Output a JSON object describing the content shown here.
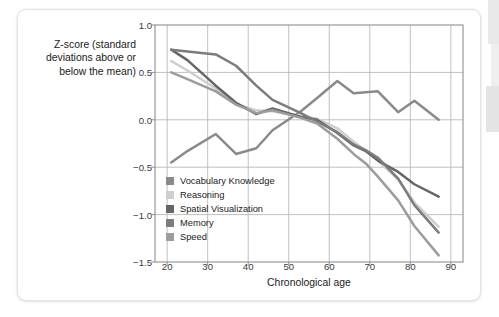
{
  "figure": {
    "background_color": "#ffffff",
    "card_border_color": "#e3e3e3"
  },
  "chart_data": {
    "type": "line",
    "title": "",
    "xlabel": "Chronological age",
    "ylabel": "Z-score (standard deviations above or below the mean)",
    "ylabel_lines": [
      "Z-score (standard",
      "deviations above or",
      "below the mean)"
    ],
    "xlim": [
      17,
      93
    ],
    "ylim": [
      -1.5,
      1.0
    ],
    "xticks": [
      20,
      30,
      40,
      50,
      60,
      70,
      80,
      90
    ],
    "xtick_labels": [
      "20",
      "30",
      "40",
      "50",
      "60",
      "70",
      "80",
      "90"
    ],
    "yticks": [
      1.0,
      0.5,
      0.0,
      -0.5,
      -1.0,
      -1.5
    ],
    "ytick_labels": [
      "1.0",
      "0.5",
      "0.0",
      "-0.5",
      "-1.0",
      "-1.5"
    ],
    "grid": true,
    "grid_color": "#b9b9b9",
    "axis_color": "#8f8f8f",
    "legend_position": "inside-lower-left",
    "series": [
      {
        "name": "Vocabulary Knowledge",
        "color": "#8a8a8a",
        "x": [
          21,
          25,
          32,
          37,
          42,
          46,
          53,
          57,
          62,
          66,
          69,
          72,
          77,
          81,
          87
        ],
        "y": [
          -0.45,
          -0.33,
          -0.15,
          -0.36,
          -0.3,
          -0.11,
          0.09,
          0.23,
          0.41,
          0.28,
          0.29,
          0.3,
          0.08,
          0.2,
          0.0
        ]
      },
      {
        "name": "Reasoning",
        "color": "#cecece",
        "x": [
          21,
          25,
          32,
          37,
          42,
          46,
          53,
          57,
          62,
          66,
          69,
          72,
          77,
          81,
          87
        ],
        "y": [
          0.62,
          0.52,
          0.33,
          0.17,
          0.1,
          0.09,
          0.04,
          0.01,
          -0.09,
          -0.23,
          -0.33,
          -0.43,
          -0.63,
          -0.87,
          -1.13
        ]
      },
      {
        "name": "Spatial Visualization",
        "color": "#666666",
        "x": [
          21,
          25,
          32,
          37,
          42,
          46,
          53,
          57,
          62,
          66,
          69,
          72,
          77,
          81,
          87
        ],
        "y": [
          0.74,
          0.63,
          0.36,
          0.18,
          0.06,
          0.12,
          0.03,
          0.0,
          -0.14,
          -0.27,
          -0.33,
          -0.43,
          -0.55,
          -0.68,
          -0.81
        ]
      },
      {
        "name": "Memory",
        "color": "#7c7c7c",
        "x": [
          21,
          25,
          32,
          37,
          42,
          46,
          53,
          57,
          62,
          66,
          69,
          72,
          77,
          81,
          87
        ],
        "y": [
          0.74,
          0.72,
          0.69,
          0.57,
          0.36,
          0.21,
          0.07,
          -0.02,
          -0.13,
          -0.26,
          -0.32,
          -0.4,
          -0.62,
          -0.9,
          -1.19
        ]
      },
      {
        "name": "Speed",
        "color": "#9c9c9c",
        "x": [
          21,
          25,
          32,
          37,
          42,
          46,
          53,
          57,
          62,
          66,
          69,
          72,
          77,
          81,
          87
        ],
        "y": [
          0.5,
          0.43,
          0.3,
          0.16,
          0.07,
          0.1,
          0.02,
          -0.04,
          -0.2,
          -0.36,
          -0.46,
          -0.6,
          -0.85,
          -1.12,
          -1.43
        ]
      }
    ]
  },
  "legend": {
    "items": [
      {
        "label": "Vocabulary Knowledge",
        "color": "#8a8a8a"
      },
      {
        "label": "Reasoning",
        "color": "#cecece"
      },
      {
        "label": "Spatial Visualization",
        "color": "#666666"
      },
      {
        "label": "Memory",
        "color": "#7c7c7c"
      },
      {
        "label": "Speed",
        "color": "#9c9c9c"
      }
    ]
  }
}
